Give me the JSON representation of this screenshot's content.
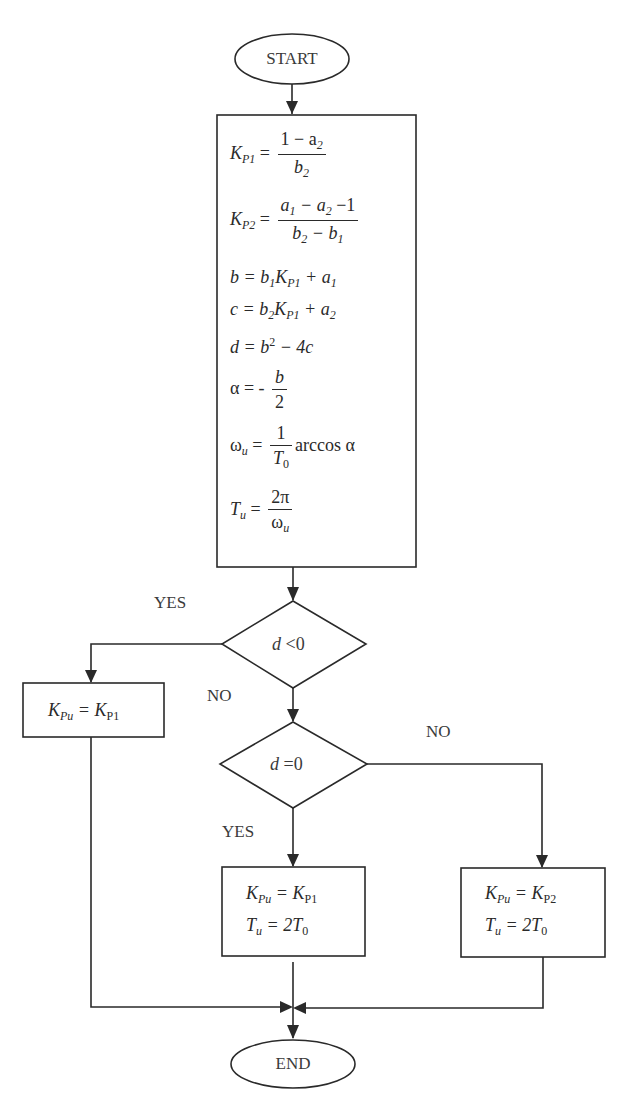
{
  "diagram": {
    "type": "flowchart",
    "colors": {
      "stroke": "#2a2a2a",
      "text": "#3a3a3a",
      "background": "#ffffff"
    },
    "start": {
      "label": "START"
    },
    "end": {
      "label": "END"
    },
    "process_main": {
      "equations": [
        {
          "lhs": "K_P1",
          "rhs": "(1 − a_2) / b_2"
        },
        {
          "lhs": "K_P2",
          "rhs": "(a_1 − a_2 − 1) / (b_2 − b_1)"
        },
        {
          "lhs": "b",
          "rhs": "b_1 K_P1 + a_1"
        },
        {
          "lhs": "c",
          "rhs": "b_2 K_P1 + a_2"
        },
        {
          "lhs": "d",
          "rhs": "b^2 − 4c"
        },
        {
          "lhs": "α",
          "rhs": "- b / 2"
        },
        {
          "lhs": "ω_u",
          "rhs": "(1 / T_0) arccos α"
        },
        {
          "lhs": "T_u",
          "rhs": "2π / ω_u"
        }
      ],
      "text": {
        "eq1_lhs": "K",
        "eq1_lhs_sub": "P1",
        "eq1_num": "1 − a",
        "eq1_num_sub": "2",
        "eq1_den": "b",
        "eq1_den_sub": "2",
        "eq2_lhs": "K",
        "eq2_lhs_sub": "P2",
        "eq2_num_a": "a",
        "eq2_num_a_sub": "1",
        "eq2_num_b": " − a",
        "eq2_num_b_sub": "2",
        "eq2_num_c": " −1",
        "eq2_den_a": "b",
        "eq2_den_a_sub": "2",
        "eq2_den_b": " − b",
        "eq2_den_b_sub": "1",
        "eq3_a": "b = b",
        "eq3_a_sub": "1",
        "eq3_b": "K",
        "eq3_b_sub": "P1",
        "eq3_c": " + a",
        "eq3_c_sub": "1",
        "eq4_a": "c = b",
        "eq4_a_sub": "2",
        "eq4_b": "K",
        "eq4_b_sub": "P1",
        "eq4_c": " + a",
        "eq4_c_sub": "2",
        "eq5_a": "d = b",
        "eq5_sup": "2",
        "eq5_b": " − 4c",
        "eq6_lhs": "α = -",
        "eq6_num": "b",
        "eq6_den": "2",
        "eq7_lhs": "ω",
        "eq7_lhs_sub": "u",
        "eq7_eq": " = ",
        "eq7_num": "1",
        "eq7_den": "T",
        "eq7_den_sub": "0",
        "eq7_tail": "arccos α",
        "eq8_lhs": "T",
        "eq8_lhs_sub": "u",
        "eq8_eq": " = ",
        "eq8_num": "2π",
        "eq8_den": "ω",
        "eq8_den_sub": "u"
      }
    },
    "decision_1": {
      "condition": "d < 0",
      "var": "d",
      "op": " <0",
      "yes_label": "YES",
      "no_label": "NO"
    },
    "decision_2": {
      "condition": "d = 0",
      "var": "d",
      "op": " =0",
      "yes_label": "YES",
      "no_label": "NO"
    },
    "process_left": {
      "lines": [
        "K_Pu = K_P1"
      ],
      "text": {
        "a": "K",
        "a_sub": "Pu",
        "b": " = K",
        "b_sub": "P1"
      }
    },
    "process_mid": {
      "lines": [
        "K_Pu = K_P1",
        "T_u = 2T_0"
      ],
      "text": {
        "a": "K",
        "a_sub": "Pu",
        "b": " = K",
        "b_sub": "P1",
        "c": "T",
        "c_sub": "u",
        "d": " = 2T",
        "d_sub": "0"
      }
    },
    "process_right": {
      "lines": [
        "K_Pu = K_P2",
        "T_u = 2T_0"
      ],
      "text": {
        "a": "K",
        "a_sub": "Pu",
        "b": " = K",
        "b_sub": "P2",
        "c": "T",
        "c_sub": "u",
        "d": " = 2T",
        "d_sub": "0"
      }
    }
  }
}
